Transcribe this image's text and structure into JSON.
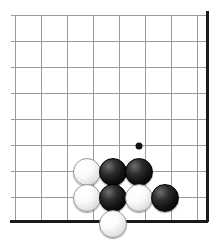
{
  "diagram": {
    "type": "go-board-diagram",
    "board": {
      "grid_origin_x": 15,
      "grid_origin_y": 15,
      "grid_spacing": 26,
      "columns": 8,
      "rows": 8,
      "line_color": "#9b9b9b",
      "edge_color": "#1a1a1a",
      "background_color": "#ffffff",
      "edge_right_x": 207,
      "edge_bottom_y": 221,
      "edge_thickness": 3,
      "line_thickness": 1
    },
    "star_points": [
      {
        "name": "star-point-1",
        "x": 139,
        "y": 146,
        "radius": 3.5,
        "color": "#111111"
      }
    ],
    "stone_radius": 14,
    "stones": [
      {
        "name": "white-stone-1",
        "color": "white",
        "x": 87,
        "y": 172
      },
      {
        "name": "black-stone-1",
        "color": "black",
        "x": 113,
        "y": 172
      },
      {
        "name": "black-stone-2",
        "color": "black",
        "x": 139,
        "y": 172
      },
      {
        "name": "white-stone-2",
        "color": "white",
        "x": 87,
        "y": 198
      },
      {
        "name": "black-stone-3",
        "color": "black",
        "x": 113,
        "y": 198
      },
      {
        "name": "white-stone-3",
        "color": "white",
        "x": 139,
        "y": 198
      },
      {
        "name": "black-stone-4",
        "color": "black",
        "x": 165,
        "y": 198
      },
      {
        "name": "white-stone-4",
        "color": "white",
        "x": 113,
        "y": 224
      }
    ],
    "colors": {
      "black_stone": "#000000",
      "white_stone": "#ffffff",
      "grid_line": "#9b9b9b",
      "board_edge": "#1a1a1a"
    }
  }
}
